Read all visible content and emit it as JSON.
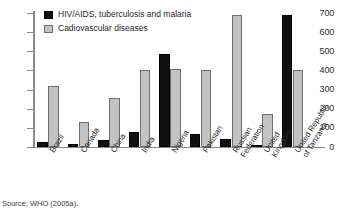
{
  "source_note": "Source: WHO (2005a).",
  "legend": {
    "position": "top-left-inside",
    "entries": [
      {
        "label": "HIV/AIDS, tuberculosis and malaria",
        "color": "#111111",
        "icon": "black-square-swatch-icon"
      },
      {
        "label": "Cadiovascular diseases",
        "color": "#c2c2c2",
        "icon": "gray-square-swatch-icon"
      }
    ]
  },
  "chart_data": {
    "type": "bar",
    "title": "",
    "subtitle": "",
    "xlabel": "",
    "ylabel": "",
    "ylim": [
      0,
      700
    ],
    "yticks": [
      0,
      100,
      200,
      300,
      400,
      500,
      600,
      700
    ],
    "ytick_labels": [
      "0",
      "100",
      "200",
      "300",
      "400",
      "500",
      "600",
      "700"
    ],
    "grid": false,
    "legend_position": "top-left-inside",
    "categories": [
      "Brazil",
      "Canada",
      "China",
      "India",
      "Nigeria",
      "Pakistan",
      "Russian\nFederation",
      "United\nKingdom",
      "United Republic\nof Tanzania"
    ],
    "series": [
      {
        "name": "HIV/AIDS, tuberculosis and malaria",
        "color": "#111111",
        "values": [
          25,
          15,
          38,
          80,
          485,
          70,
          42,
          6,
          690
        ]
      },
      {
        "name": "Cadiovascular diseases",
        "color": "#c2c2c2",
        "values": [
          320,
          130,
          255,
          402,
          410,
          400,
          690,
          175,
          400
        ]
      }
    ]
  }
}
